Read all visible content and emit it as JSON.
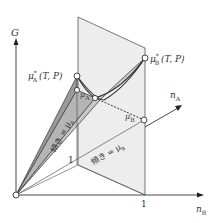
{
  "axes": {
    "g_label": "G",
    "na_label": "n",
    "na_sub": "A",
    "nb_label": "n",
    "nb_sub": "B",
    "nb_tick": "1",
    "plane_tick": "1"
  },
  "points": {
    "mu_a_star": {
      "sym": "μ",
      "sub": "A",
      "sup": "*",
      "args": "(T, P)"
    },
    "mu_b_star": {
      "sym": "μ",
      "sub": "B",
      "sup": "*",
      "args": "(T, P)"
    },
    "mu_a": {
      "sym": "μ",
      "sub": "A"
    },
    "mu": {
      "sym": "μ"
    },
    "mu_b": {
      "sym": "μ",
      "sub": "B"
    }
  },
  "annotations": {
    "slope_a": "傾き = μ",
    "slope_a_sub": "A",
    "slope_b": "傾き = μ",
    "slope_b_sub": "B"
  },
  "colors": {
    "line": "#444444",
    "plane_fill": "#ededed",
    "wedge_dark": "#9a9a9a",
    "wedge_light": "#c4c4c4"
  }
}
